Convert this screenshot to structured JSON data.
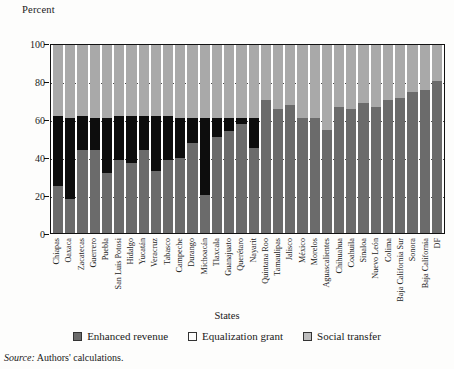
{
  "figure": {
    "y_axis_title": "Percent",
    "x_axis_title": "States",
    "source_prefix": "Source:",
    "source_text": "Authors' calculations."
  },
  "legend": {
    "items": [
      {
        "label": "Enhanced revenue",
        "color": "#6b6b6b",
        "swatch": "enhanced-swatch"
      },
      {
        "label": "Equalization grant",
        "color": "#0d0d0d",
        "swatch": "equalization-swatch"
      },
      {
        "label": "Social transfer",
        "color": "#bdbdbd",
        "swatch": "social-swatch"
      }
    ]
  },
  "chart_data": {
    "type": "bar",
    "stacked": true,
    "normalized": true,
    "title": "",
    "subtitle": "",
    "xlabel": "States",
    "ylabel": "Percent",
    "ylim": [
      0,
      100
    ],
    "yticks": [
      0,
      20,
      40,
      60,
      80,
      100
    ],
    "ytick_labels": [
      "0",
      "20",
      "40",
      "60",
      "80",
      "100"
    ],
    "grid": true,
    "grid_style": "dotted horizontal",
    "legend_position": "bottom",
    "categories": [
      "Chiapas",
      "Oaxaca",
      "Zacatecas",
      "Guerrero",
      "Puebla",
      "San Luis Potosi",
      "Hidalgo",
      "Yucatán",
      "Veracruz",
      "Tabasco",
      "Campeche",
      "Durango",
      "Michoacán",
      "Tlaxcala",
      "Guanajuato",
      "Querétaro",
      "Nayarit",
      "Quintana Roo",
      "Tamaulipas",
      "Jalisco",
      "México",
      "Morelos",
      "Aguascalientes",
      "Chihuahua",
      "Coahuila",
      "Sinaloa",
      "Nuevo León",
      "Colima",
      "Baja California Sur",
      "Sonora",
      "Baja California",
      "DF"
    ],
    "series": [
      {
        "name": "Enhanced revenue",
        "color": "#6b6b6b",
        "values": [
          25,
          18,
          44,
          44,
          32,
          39,
          37,
          44,
          33,
          39,
          40,
          48,
          20,
          51,
          54,
          58,
          45,
          71,
          66,
          68,
          61,
          61,
          55,
          67,
          66,
          69,
          67,
          71,
          72,
          75,
          76,
          81
        ]
      },
      {
        "name": "Equalization grant",
        "color": "#0d0d0d",
        "values": [
          37,
          43,
          18,
          17,
          29,
          23,
          25,
          18,
          29,
          23,
          21,
          13,
          41,
          10,
          7,
          3,
          16,
          0,
          0,
          0,
          0,
          0,
          0,
          0,
          0,
          0,
          0,
          0,
          0,
          0,
          0,
          0
        ]
      },
      {
        "name": "Social transfer",
        "color": "#bdbdbd",
        "values": [
          38,
          39,
          38,
          39,
          39,
          38,
          38,
          38,
          38,
          38,
          39,
          39,
          39,
          39,
          39,
          39,
          39,
          29,
          34,
          32,
          39,
          39,
          45,
          33,
          34,
          31,
          33,
          29,
          28,
          25,
          24,
          19
        ]
      }
    ]
  }
}
